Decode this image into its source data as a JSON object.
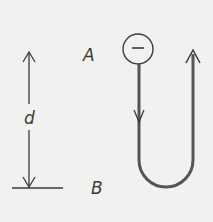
{
  "diagram": {
    "labels": {
      "point_a": "A",
      "point_b": "B",
      "distance": "d",
      "charge_sign": "−"
    },
    "colors": {
      "background": "#f1f1ef",
      "ink": "#3a3a3a",
      "path": "#555555"
    }
  }
}
